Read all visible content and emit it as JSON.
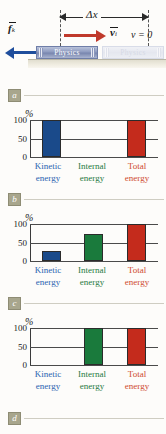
{
  "figure": {
    "diagram": {
      "displacement_label": "Δx",
      "velocity_label": "v",
      "velocity_subscript": "i",
      "final_velocity_text": "v = 0",
      "friction_label": "f",
      "friction_subscript": "k",
      "book_initial_title": "Physics",
      "book_final_title": "Physics"
    },
    "panels": [
      {
        "badge": "a"
      },
      {
        "badge": "b"
      },
      {
        "badge": "c"
      },
      {
        "badge": "d"
      }
    ],
    "colors": {
      "kinetic": "#1a4a8a",
      "internal": "#1a7a3c",
      "total": "#c42b1c",
      "kinetic_label": "#2b63b0",
      "internal_label": "#1f7a42",
      "total_label": "#cf4a2e",
      "friction_arrow": "#1f4e9c",
      "velocity_arrow": "#c0392b",
      "badge_bg": "#a8a68d"
    }
  },
  "chart_data": [
    {
      "type": "bar",
      "panel": "a",
      "title": "",
      "ylabel": "%",
      "categories": [
        "Kinetic energy",
        "Internal energy",
        "Total energy"
      ],
      "values": [
        100,
        0,
        100
      ],
      "yticks": [
        0,
        50,
        100
      ],
      "ylim": [
        0,
        100
      ],
      "grid": true,
      "bar_colors": [
        "#1a4a8a",
        "#1a7a3c",
        "#c42b1c"
      ]
    },
    {
      "type": "bar",
      "panel": "b",
      "title": "",
      "ylabel": "%",
      "categories": [
        "Kinetic energy",
        "Internal energy",
        "Total energy"
      ],
      "values": [
        28,
        72,
        100
      ],
      "yticks": [
        0,
        50,
        100
      ],
      "ylim": [
        0,
        100
      ],
      "grid": true,
      "bar_colors": [
        "#1a4a8a",
        "#1a7a3c",
        "#c42b1c"
      ]
    },
    {
      "type": "bar",
      "panel": "c",
      "title": "",
      "ylabel": "%",
      "categories": [
        "Kinetic energy",
        "Internal energy",
        "Total energy"
      ],
      "values": [
        0,
        100,
        100
      ],
      "yticks": [
        0,
        50,
        100
      ],
      "ylim": [
        0,
        100
      ],
      "grid": true,
      "bar_colors": [
        "#1a4a8a",
        "#1a7a3c",
        "#c42b1c"
      ]
    }
  ]
}
